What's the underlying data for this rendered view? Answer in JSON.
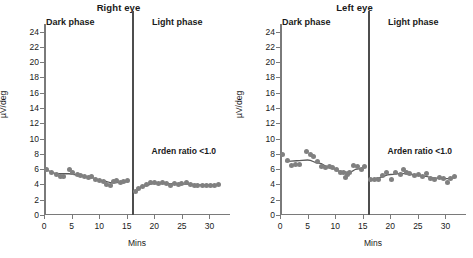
{
  "figure": {
    "xlabel": "Mins",
    "ylabel": "µV/deg"
  },
  "chart_data": [
    {
      "type": "scatter",
      "title": "Right eye",
      "xlabel": "Mins",
      "ylabel": "µV/deg",
      "xlim": [
        0,
        33
      ],
      "ylim": [
        0,
        25
      ],
      "yticks": [
        0,
        2,
        4,
        6,
        8,
        10,
        12,
        14,
        16,
        18,
        20,
        22,
        24
      ],
      "xticks": [
        0,
        5,
        10,
        15,
        20,
        25,
        30
      ],
      "grid": false,
      "legend": null,
      "annotations": [
        {
          "text": "Dark phase",
          "x": 4,
          "y": 24.4
        },
        {
          "text": "Light phase",
          "x": 22,
          "y": 24.4
        },
        {
          "text": "Arden ratio <1.0",
          "x": 19.5,
          "y": 8.2
        }
      ],
      "phase_divider_x": 16,
      "series": [
        {
          "name": "Dark phase",
          "marker": "circle",
          "color": "#808080",
          "x": [
            0.5,
            1.3,
            2.2,
            3.0,
            3.6,
            4.7,
            5.2,
            6.0,
            6.7,
            7.4,
            8.1,
            8.7,
            9.3,
            10.0,
            10.7,
            11.4,
            12.0,
            12.6,
            13.2,
            13.9,
            14.5,
            15.2
          ],
          "y": [
            5.9,
            5.5,
            5.3,
            5.0,
            5.1,
            6.0,
            5.5,
            5.3,
            5.2,
            5.0,
            4.9,
            5.0,
            4.6,
            4.5,
            4.4,
            4.0,
            3.8,
            4.4,
            4.5,
            4.2,
            4.4,
            4.5
          ]
        },
        {
          "name": "Light phase",
          "marker": "circle",
          "color": "#808080",
          "x": [
            16.5,
            17.2,
            17.9,
            18.6,
            19.3,
            20.0,
            20.8,
            21.5,
            22.2,
            22.9,
            23.6,
            24.3,
            25.0,
            25.8,
            26.5,
            27.2,
            27.9,
            28.7,
            29.4,
            30.2,
            31.0,
            31.7
          ],
          "y": [
            3.1,
            3.5,
            3.7,
            4.0,
            4.2,
            4.2,
            4.1,
            4.2,
            4.1,
            3.9,
            4.1,
            4.0,
            4.1,
            4.2,
            4.0,
            3.9,
            3.9,
            3.9,
            3.9,
            3.9,
            3.9,
            4.0
          ]
        }
      ],
      "trend_lines": [
        {
          "name": "Dark phase trend",
          "x": [
            0.5,
            2.5,
            4.5,
            6.5,
            8.5,
            10.5,
            12.5,
            14.0,
            15.3
          ],
          "y": [
            5.8,
            5.4,
            5.4,
            5.2,
            4.9,
            4.5,
            4.2,
            4.3,
            4.35
          ]
        },
        {
          "name": "Light phase trend",
          "x": [
            16.4,
            18.0,
            20.0,
            22.0,
            24.0,
            26.0,
            28.0,
            30.0,
            31.8
          ],
          "y": [
            3.1,
            3.8,
            4.1,
            4.1,
            4.1,
            4.05,
            3.95,
            3.95,
            4.0
          ]
        }
      ]
    },
    {
      "type": "scatter",
      "title": "Left eye",
      "xlabel": "Mins",
      "ylabel": "µV/deg",
      "xlim": [
        0,
        33
      ],
      "ylim": [
        0,
        25
      ],
      "yticks": [
        0,
        2,
        4,
        6,
        8,
        10,
        12,
        14,
        16,
        18,
        20,
        22,
        24
      ],
      "xticks": [
        0,
        5,
        10,
        15,
        20,
        25,
        30
      ],
      "grid": false,
      "legend": null,
      "annotations": [
        {
          "text": "Dark phase",
          "x": 4,
          "y": 24.4
        },
        {
          "text": "Light phase",
          "x": 22,
          "y": 24.4
        },
        {
          "text": "Arden ratio <1.0",
          "x": 19.5,
          "y": 8.2
        }
      ],
      "phase_divider_x": 16,
      "series": [
        {
          "name": "Dark phase",
          "marker": "circle",
          "color": "#808080",
          "x": [
            0.5,
            1.3,
            2.1,
            2.8,
            3.5,
            4.8,
            5.5,
            6.1,
            6.8,
            7.5,
            8.2,
            8.9,
            9.6,
            10.3,
            11.0,
            11.6,
            11.9,
            12.3,
            12.6,
            13.3,
            14.0,
            14.7,
            15.3
          ],
          "y": [
            7.9,
            7.1,
            6.5,
            6.6,
            6.6,
            8.3,
            7.9,
            7.6,
            7.0,
            6.3,
            6.2,
            6.3,
            6.2,
            6.0,
            5.6,
            5.6,
            4.9,
            5.3,
            5.6,
            6.5,
            6.3,
            5.9,
            6.3
          ]
        },
        {
          "name": "Light phase",
          "marker": "circle",
          "color": "#808080",
          "x": [
            16.4,
            17.1,
            17.8,
            18.6,
            19.4,
            20.2,
            21.0,
            21.8,
            22.4,
            22.9,
            23.5,
            24.3,
            25.1,
            25.9,
            26.6,
            27.3,
            28.1,
            28.9,
            29.6,
            30.3,
            31.0,
            31.6
          ],
          "y": [
            4.6,
            4.6,
            4.7,
            5.2,
            5.5,
            4.6,
            5.6,
            5.3,
            5.9,
            5.6,
            5.4,
            5.2,
            5.3,
            5.1,
            5.4,
            4.8,
            4.7,
            4.9,
            4.8,
            4.3,
            4.8,
            5.1
          ]
        }
      ],
      "trend_lines": [
        {
          "name": "Dark phase trend",
          "x": [
            1.0,
            3.0,
            5.0,
            7.0,
            9.0,
            11.0,
            12.5,
            14.0,
            15.3
          ],
          "y": [
            7.0,
            7.1,
            7.2,
            6.8,
            6.2,
            5.7,
            5.6,
            6.0,
            6.2
          ]
        },
        {
          "name": "Light phase trend",
          "x": [
            16.4,
            18.0,
            20.0,
            22.0,
            24.0,
            26.0,
            28.0,
            30.0,
            31.7
          ],
          "y": [
            4.6,
            4.9,
            5.3,
            5.45,
            5.3,
            5.1,
            4.85,
            4.75,
            4.85
          ]
        }
      ]
    }
  ]
}
